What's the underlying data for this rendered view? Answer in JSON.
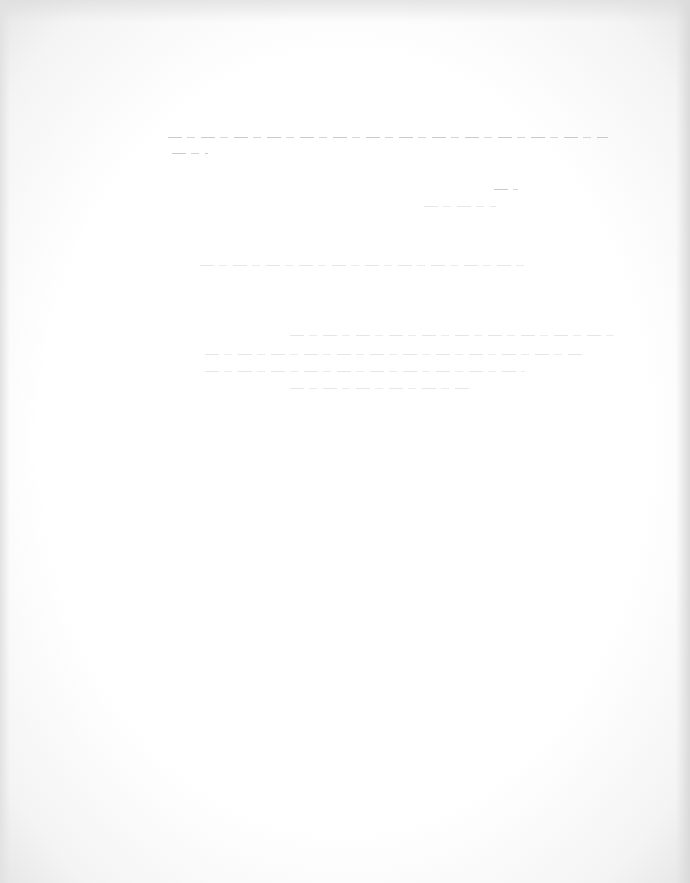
{
  "document": {
    "type": "scanned-page",
    "legibility": "text too faded to read",
    "text_lines": [
      {
        "id": "line-1",
        "x": 168,
        "y": 137,
        "w": 440,
        "strength": "normal"
      },
      {
        "id": "line-2",
        "x": 172,
        "y": 153,
        "w": 36,
        "strength": "normal"
      },
      {
        "id": "line-3",
        "x": 494,
        "y": 189,
        "w": 24,
        "strength": "normal"
      },
      {
        "id": "line-4",
        "x": 424,
        "y": 206,
        "w": 72,
        "strength": "light"
      },
      {
        "id": "line-5",
        "x": 200,
        "y": 265,
        "w": 330,
        "strength": "light"
      },
      {
        "id": "line-6",
        "x": 290,
        "y": 335,
        "w": 330,
        "strength": "light"
      },
      {
        "id": "line-7",
        "x": 205,
        "y": 354,
        "w": 380,
        "strength": "light"
      },
      {
        "id": "line-8",
        "x": 205,
        "y": 371,
        "w": 320,
        "strength": "light"
      },
      {
        "id": "line-9",
        "x": 290,
        "y": 388,
        "w": 180,
        "strength": "light"
      }
    ]
  },
  "colors": {
    "paper": "#ffffff",
    "edge_shadow": "#dcdcdc",
    "ink_faded": "#b8b8b8"
  }
}
